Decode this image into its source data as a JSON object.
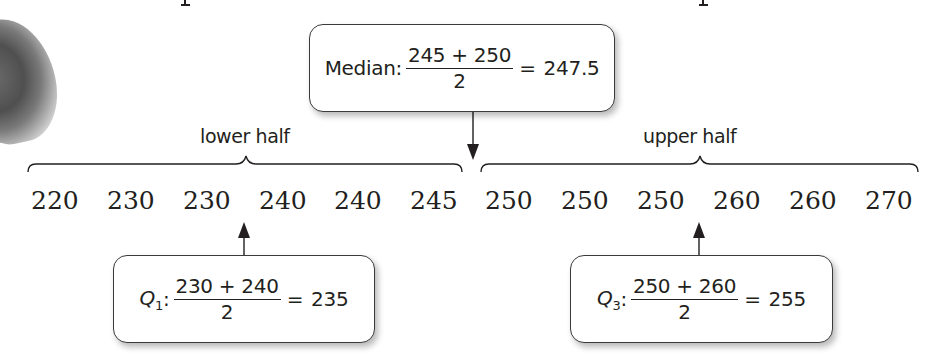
{
  "median_callout": {
    "label": "Median:",
    "numerator": "245 + 250",
    "denominator": "2",
    "equals": "=",
    "result": "247.5"
  },
  "halves": {
    "lower_label": "lower half",
    "upper_label": "upper half"
  },
  "data_values": [
    "220",
    "230",
    "230",
    "240",
    "240",
    "245",
    "250",
    "250",
    "250",
    "260",
    "260",
    "270"
  ],
  "q1_callout": {
    "label": "Q",
    "subscript": "1",
    "colon": ":",
    "numerator": "230 + 240",
    "denominator": "2",
    "equals": "=",
    "result": "235"
  },
  "q3_callout": {
    "label": "Q",
    "subscript": "3",
    "colon": ":",
    "numerator": "250 + 260",
    "denominator": "2",
    "equals": "=",
    "result": "255"
  },
  "colors": {
    "ink": "#231f20",
    "border": "#3a3a3a",
    "background": "#ffffff"
  }
}
